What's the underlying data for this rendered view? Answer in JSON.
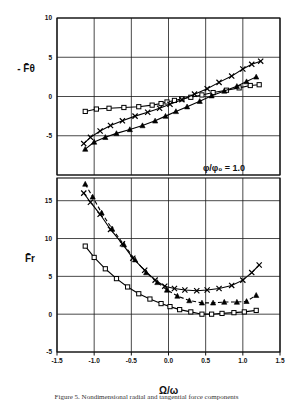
{
  "figure": {
    "annotation": "φ/φ₀ = 1.0",
    "xlabel": "Ω/ω",
    "upper_ylabel": "- F̄θ",
    "lower_ylabel": "F̄r",
    "caption": "Figure 5. Nondimensional radial and tangential force components"
  },
  "chart_data": [
    {
      "type": "line",
      "id": "upper-panel",
      "title": "",
      "xlabel": "Ω/ω",
      "ylabel": "- F̄θ",
      "xlim": [
        -1.5,
        1.5
      ],
      "ylim": [
        -10,
        10
      ],
      "xticks": [
        -1.5,
        -1.0,
        -0.5,
        0.0,
        0.5,
        1.0,
        1.5
      ],
      "xticklabels": [
        "-1.5",
        "-1.0",
        "-0.5",
        "0.0",
        "0.5",
        "1.0",
        "1.5"
      ],
      "yticks": [
        -10,
        -5,
        0,
        5,
        10
      ],
      "yticklabels": [
        "",
        "-5",
        "0",
        "5",
        "10"
      ],
      "grid": true,
      "annotation": "φ/φ₀ = 1.0",
      "series": [
        {
          "name": "square",
          "marker": "square",
          "linestyle": "solid",
          "x": [
            -1.12,
            -0.97,
            -0.8,
            -0.6,
            -0.4,
            -0.22,
            -0.1,
            -0.02,
            0.08,
            0.18,
            0.3,
            0.45,
            0.6,
            0.78,
            0.95,
            1.1,
            1.22
          ],
          "y": [
            -1.9,
            -1.6,
            -1.5,
            -1.4,
            -1.3,
            -1.1,
            -0.9,
            -0.7,
            -0.5,
            -0.3,
            -0.1,
            0.2,
            0.5,
            0.8,
            1.1,
            1.4,
            1.5
          ]
        },
        {
          "name": "cross",
          "marker": "cross",
          "linestyle": "solid",
          "x": [
            -1.14,
            -1.05,
            -0.92,
            -0.78,
            -0.62,
            -0.45,
            -0.28,
            -0.12,
            0.02,
            0.18,
            0.35,
            0.52,
            0.68,
            0.85,
            1.0,
            1.12,
            1.24
          ],
          "y": [
            -6.0,
            -5.2,
            -4.4,
            -3.7,
            -3.1,
            -2.5,
            -2.0,
            -1.5,
            -1.0,
            -0.4,
            0.3,
            1.0,
            1.8,
            2.6,
            3.5,
            4.1,
            4.5
          ]
        },
        {
          "name": "triangle",
          "marker": "triangle",
          "linestyle": "solid",
          "x": [
            -1.12,
            -1.0,
            -0.85,
            -0.7,
            -0.52,
            -0.35,
            -0.18,
            -0.04,
            0.1,
            0.25,
            0.42,
            0.58,
            0.75,
            0.92,
            1.05,
            1.18
          ],
          "y": [
            -6.7,
            -5.8,
            -5.2,
            -4.7,
            -4.2,
            -3.7,
            -3.1,
            -2.5,
            -1.9,
            -1.3,
            -0.6,
            0.1,
            0.7,
            1.3,
            1.9,
            2.5
          ]
        }
      ]
    },
    {
      "type": "line",
      "id": "lower-panel",
      "title": "",
      "xlabel": "Ω/ω",
      "ylabel": "F̄r",
      "xlim": [
        -1.5,
        1.5
      ],
      "ylim": [
        -5,
        18
      ],
      "xticks": [
        -1.5,
        -1.0,
        -0.5,
        0.0,
        0.5,
        1.0,
        1.5
      ],
      "xticklabels": [
        "-1.5",
        "-1.0",
        "-0.5",
        "0.0",
        "0.5",
        "1.0",
        "1.5"
      ],
      "yticks": [
        -5,
        0,
        5,
        10,
        15
      ],
      "yticklabels": [
        "-5",
        "0",
        "5",
        "10",
        "15"
      ],
      "grid": true,
      "series": [
        {
          "name": "square",
          "marker": "square",
          "linestyle": "solid",
          "x": [
            -1.12,
            -1.0,
            -0.85,
            -0.7,
            -0.55,
            -0.4,
            -0.25,
            -0.1,
            0.02,
            0.15,
            0.3,
            0.45,
            0.58,
            0.72,
            0.88,
            1.02,
            1.18
          ],
          "y": [
            9.0,
            7.5,
            6.0,
            4.7,
            3.6,
            2.7,
            2.0,
            1.4,
            1.0,
            0.6,
            0.3,
            0.0,
            0.0,
            0.1,
            0.2,
            0.3,
            0.5
          ]
        },
        {
          "name": "cross",
          "marker": "cross",
          "linestyle": "solid",
          "x": [
            -1.14,
            -1.05,
            -0.92,
            -0.78,
            -0.62,
            -0.48,
            -0.32,
            -0.18,
            -0.05,
            0.08,
            0.22,
            0.38,
            0.52,
            0.68,
            0.85,
            1.0,
            1.12,
            1.22
          ],
          "y": [
            16.0,
            14.8,
            13.2,
            11.2,
            9.3,
            7.4,
            5.8,
            4.5,
            3.7,
            3.4,
            3.2,
            3.1,
            3.2,
            3.4,
            3.8,
            4.5,
            5.5,
            6.5
          ]
        },
        {
          "name": "triangle",
          "marker": "triangle",
          "linestyle": "dashed",
          "x": [
            -1.12,
            -1.02,
            -0.9,
            -0.76,
            -0.6,
            -0.45,
            -0.3,
            -0.15,
            -0.02,
            0.12,
            0.28,
            0.45,
            0.6,
            0.75,
            0.92,
            1.05,
            1.18
          ],
          "y": [
            17.2,
            15.5,
            13.4,
            11.3,
            9.2,
            7.2,
            5.5,
            4.2,
            3.2,
            2.4,
            1.8,
            1.5,
            1.5,
            1.6,
            1.6,
            1.7,
            2.5
          ]
        }
      ]
    }
  ]
}
